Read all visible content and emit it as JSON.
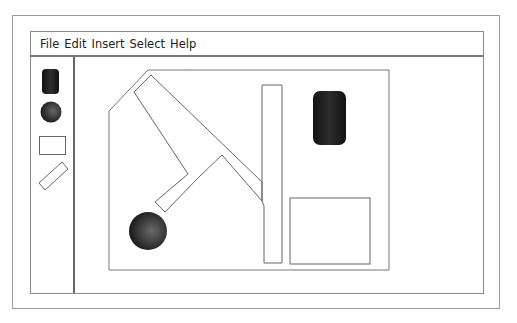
{
  "menu": {
    "items": [
      {
        "label": "File"
      },
      {
        "label": "Edit"
      },
      {
        "label": "Insert"
      },
      {
        "label": "Select"
      },
      {
        "label": "Help"
      }
    ]
  },
  "toolbar": {
    "tools": [
      {
        "name": "cylinder-tool",
        "icon": "cylinder-icon"
      },
      {
        "name": "sphere-tool",
        "icon": "sphere-icon"
      },
      {
        "name": "rectangle-tool",
        "icon": "rectangle-icon"
      },
      {
        "name": "rotated-rectangle-tool",
        "icon": "rotated-rectangle-icon"
      }
    ]
  },
  "canvas": {
    "objects": [
      {
        "type": "room-outline"
      },
      {
        "type": "diagonal-wall"
      },
      {
        "type": "vertical-wall"
      },
      {
        "type": "cylinder"
      },
      {
        "type": "sphere"
      },
      {
        "type": "rectangle"
      }
    ],
    "colors": {
      "stroke": "#777777",
      "fill_dark": "#1e1e1e"
    }
  }
}
